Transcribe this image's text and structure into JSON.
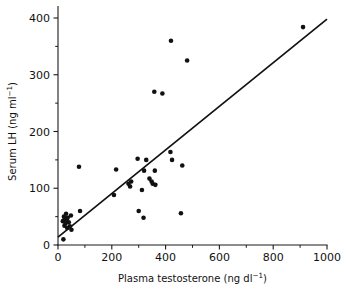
{
  "chart_data": {
    "type": "scatter",
    "title": "",
    "xlabel": "Plasma testosterone (ng dl⁻¹)",
    "xlabel_main": "Plasma testosterone (ng dl",
    "xlabel_sup": "−1",
    "xlabel_tail": ")",
    "ylabel": "Serum LH (ng ml⁻¹)",
    "ylabel_main": "Serum LH (ng ml",
    "ylabel_sup": "−1",
    "ylabel_tail": ")",
    "xlim": [
      0,
      1000
    ],
    "ylim": [
      0,
      420
    ],
    "xticks": [
      0,
      200,
      400,
      600,
      800,
      1000
    ],
    "xticklabels": [
      "0",
      "200",
      "400",
      "600",
      "800",
      "1000"
    ],
    "xminorticks": [
      100,
      300,
      500,
      700,
      900
    ],
    "yticks": [
      0,
      100,
      200,
      300,
      400
    ],
    "yticklabels": [
      "0",
      "100",
      "200",
      "300",
      "400"
    ],
    "yminorticks": [
      50,
      150,
      250,
      350
    ],
    "grid": false,
    "legend": null,
    "marker": "filled-circle",
    "marker_color": "#111111",
    "marker_size_px": 4.4,
    "points": [
      [
        20,
        10
      ],
      [
        18,
        42
      ],
      [
        22,
        50
      ],
      [
        24,
        34
      ],
      [
        26,
        46
      ],
      [
        28,
        38
      ],
      [
        30,
        55
      ],
      [
        32,
        44
      ],
      [
        34,
        30
      ],
      [
        36,
        48
      ],
      [
        40,
        40
      ],
      [
        44,
        33
      ],
      [
        48,
        52
      ],
      [
        50,
        27
      ],
      [
        78,
        138
      ],
      [
        82,
        60
      ],
      [
        208,
        88
      ],
      [
        216,
        133
      ],
      [
        262,
        108
      ],
      [
        268,
        103
      ],
      [
        272,
        112
      ],
      [
        296,
        152
      ],
      [
        300,
        60
      ],
      [
        312,
        97
      ],
      [
        318,
        48
      ],
      [
        320,
        131
      ],
      [
        328,
        150
      ],
      [
        340,
        117
      ],
      [
        348,
        112
      ],
      [
        352,
        108
      ],
      [
        358,
        270
      ],
      [
        360,
        131
      ],
      [
        362,
        106
      ],
      [
        388,
        267
      ],
      [
        418,
        164
      ],
      [
        420,
        360
      ],
      [
        424,
        150
      ],
      [
        457,
        56
      ],
      [
        462,
        140
      ],
      [
        480,
        325
      ],
      [
        911,
        384
      ]
    ],
    "fit_line": {
      "type": "linear-regression",
      "x_start": 0,
      "y_start": 14,
      "x_end": 1000,
      "y_end": 398,
      "color": "#111111"
    }
  }
}
